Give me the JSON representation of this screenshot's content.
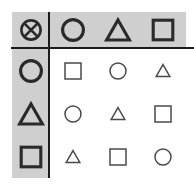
{
  "figure": {
    "kind": "binary-operation-table",
    "operator_symbol": "circled-cross",
    "operator_label": "⊗",
    "elements": [
      "circle",
      "triangle",
      "square"
    ],
    "element_labels": {
      "circle": "○",
      "triangle": "△",
      "square": "□"
    },
    "colors": {
      "page_background": "#ffffff",
      "header_band": "#cfcfcf",
      "rule": "#1b1b1b",
      "header_glyph_stroke": "#2a2a2a",
      "body_glyph_stroke": "#4a4a4a"
    },
    "header": {
      "corner": "circled-cross",
      "columns": [
        "circle",
        "triangle",
        "square"
      ],
      "rows": [
        "circle",
        "triangle",
        "square"
      ]
    },
    "body": [
      [
        "square",
        "circle",
        "triangle"
      ],
      [
        "circle",
        "triangle",
        "square"
      ],
      [
        "triangle",
        "square",
        "circle"
      ]
    ],
    "cells": {
      "corner": "⊗",
      "col_0": "○",
      "col_1": "△",
      "col_2": "□",
      "row_0": "○",
      "row_1": "△",
      "row_2": "□",
      "r0c0": "□",
      "r0c1": "○",
      "r0c2": "△",
      "r1c0": "○",
      "r1c1": "△",
      "r1c2": "□",
      "r2c0": "△",
      "r2c1": "□",
      "r2c2": "○"
    }
  }
}
